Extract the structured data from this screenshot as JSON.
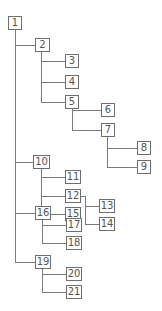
{
  "diagram": {
    "type": "tree",
    "line_color": "#7a7a7a",
    "box_border_color": "#6e6e6e",
    "text_color": "#555555",
    "nodes": [
      {
        "id": "1",
        "label": "1",
        "x": 8,
        "y": 16,
        "w": 14
      },
      {
        "id": "2",
        "label": "2",
        "x": 35,
        "y": 38,
        "w": 15
      },
      {
        "id": "3",
        "label": "3",
        "x": 65,
        "y": 54,
        "w": 14
      },
      {
        "id": "4",
        "label": "4",
        "x": 65,
        "y": 75,
        "w": 14
      },
      {
        "id": "5",
        "label": "5",
        "x": 65,
        "y": 95,
        "w": 14
      },
      {
        "id": "6",
        "label": "6",
        "x": 101,
        "y": 103,
        "w": 14
      },
      {
        "id": "7",
        "label": "7",
        "x": 101,
        "y": 123,
        "w": 14
      },
      {
        "id": "8",
        "label": "8",
        "x": 137,
        "y": 141,
        "w": 14
      },
      {
        "id": "9",
        "label": "9",
        "x": 137,
        "y": 160,
        "w": 14
      },
      {
        "id": "10",
        "label": "10",
        "x": 33,
        "y": 155,
        "w": 17
      },
      {
        "id": "11",
        "label": "11",
        "x": 65,
        "y": 170,
        "w": 16
      },
      {
        "id": "12",
        "label": "12",
        "x": 65,
        "y": 189,
        "w": 16
      },
      {
        "id": "15",
        "label": "15",
        "x": 65,
        "y": 207,
        "w": 16
      },
      {
        "id": "13",
        "label": "13",
        "x": 99,
        "y": 199,
        "w": 16
      },
      {
        "id": "14",
        "label": "14",
        "x": 99,
        "y": 217,
        "w": 16
      },
      {
        "id": "16",
        "label": "16",
        "x": 35,
        "y": 206,
        "w": 16
      },
      {
        "id": "17",
        "label": "17",
        "x": 66,
        "y": 218,
        "w": 16
      },
      {
        "id": "18",
        "label": "18",
        "x": 66,
        "y": 236,
        "w": 16
      },
      {
        "id": "19",
        "label": "19",
        "x": 35,
        "y": 255,
        "w": 16
      },
      {
        "id": "20",
        "label": "20",
        "x": 66,
        "y": 267,
        "w": 16
      },
      {
        "id": "21",
        "label": "21",
        "x": 66,
        "y": 285,
        "w": 16
      }
    ],
    "edges": [
      [
        "1",
        "2"
      ],
      [
        "1",
        "10"
      ],
      [
        "1",
        "16"
      ],
      [
        "1",
        "19"
      ],
      [
        "2",
        "3"
      ],
      [
        "2",
        "4"
      ],
      [
        "2",
        "5"
      ],
      [
        "5",
        "6"
      ],
      [
        "5",
        "7"
      ],
      [
        "7",
        "8"
      ],
      [
        "7",
        "9"
      ],
      [
        "10",
        "11"
      ],
      [
        "10",
        "12"
      ],
      [
        "10",
        "15"
      ],
      [
        "12",
        "13"
      ],
      [
        "12",
        "14"
      ],
      [
        "16",
        "17"
      ],
      [
        "16",
        "18"
      ],
      [
        "19",
        "20"
      ],
      [
        "19",
        "21"
      ]
    ]
  }
}
